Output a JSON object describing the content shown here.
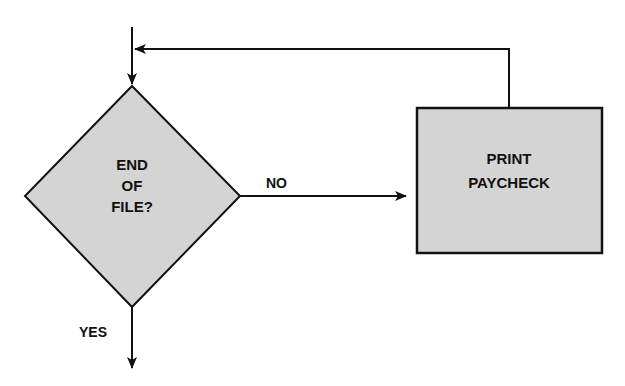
{
  "diagram": {
    "type": "flowchart",
    "colors": {
      "shape_fill": "#d4d4d4",
      "stroke": "#111111",
      "background": "#ffffff"
    },
    "nodes": {
      "decision": {
        "shape": "diamond",
        "lines": [
          "END",
          "OF",
          "FILE?"
        ]
      },
      "process": {
        "shape": "rectangle",
        "lines": [
          "PRINT",
          "PAYCHECK"
        ]
      }
    },
    "edges": {
      "entry": {
        "from": "start",
        "to": "decision",
        "label": ""
      },
      "no": {
        "from": "decision",
        "to": "process",
        "label": "NO"
      },
      "yes": {
        "from": "decision",
        "to": "exit",
        "label": "YES"
      },
      "loop": {
        "from": "process",
        "to": "decision",
        "label": ""
      }
    }
  }
}
